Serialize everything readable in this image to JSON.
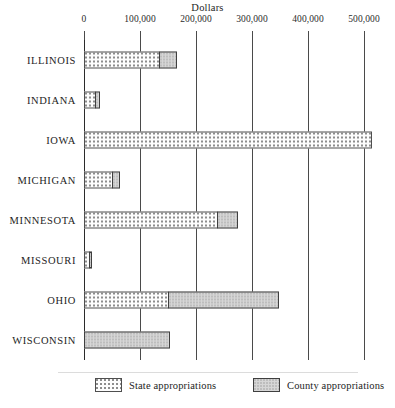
{
  "chart_data": {
    "type": "bar",
    "orientation": "horizontal",
    "stacked": true,
    "title": "",
    "xlabel": "Dollars",
    "ylabel": "",
    "xlim": [
      0,
      520000
    ],
    "grid": true,
    "legend_position": "bottom",
    "xticks": [
      0,
      100000,
      200000,
      300000,
      400000,
      500000
    ],
    "xticklabels": [
      "0",
      "100,000",
      "200,000",
      "300,000",
      "400,000",
      "500,000"
    ],
    "categories": [
      "ILLINOIS",
      "INDIANA",
      "IOWA",
      "MICHIGAN",
      "MINNESOTA",
      "MISSOURI",
      "OHIO",
      "WISCONSIN"
    ],
    "series": [
      {
        "name": "State appropriations",
        "pattern": "dotted",
        "values": [
          136000,
          21000,
          514000,
          52000,
          239000,
          11000,
          152000,
          0
        ]
      },
      {
        "name": "County appropriations",
        "pattern": "solid-gray",
        "values": [
          32000,
          9000,
          0,
          14000,
          38000,
          5000,
          198000,
          154000
        ]
      }
    ],
    "totals": [
      168000,
      30000,
      514000,
      66000,
      277000,
      16000,
      350000,
      154000
    ]
  },
  "axis": {
    "title": "Dollars",
    "ticks": [
      {
        "label": "0",
        "value": 0
      },
      {
        "label": "100,000",
        "value": 100000
      },
      {
        "label": "200,000",
        "value": 200000
      },
      {
        "label": "300,000",
        "value": 300000
      },
      {
        "label": "400,000",
        "value": 400000
      },
      {
        "label": "500,000",
        "value": 500000
      }
    ]
  },
  "rows": [
    {
      "label": "ILLINOIS",
      "state": 136000,
      "county": 32000
    },
    {
      "label": "INDIANA",
      "state": 21000,
      "county": 9000
    },
    {
      "label": "IOWA",
      "state": 514000,
      "county": 0
    },
    {
      "label": "MICHIGAN",
      "state": 52000,
      "county": 14000
    },
    {
      "label": "MINNESOTA",
      "state": 239000,
      "county": 38000
    },
    {
      "label": "MISSOURI",
      "state": 11000,
      "county": 5000
    },
    {
      "label": "OHIO",
      "state": 152000,
      "county": 198000
    },
    {
      "label": "WISCONSIN",
      "state": 0,
      "county": 154000
    }
  ],
  "legend": {
    "state_label": "State appropriations",
    "county_label": "County appropriations"
  },
  "colors": {
    "state_fill": "#fdfdfd",
    "state_dots": "#8d8d8d",
    "county_fill": "#d6d6d6",
    "outline": "#4f4f4f",
    "gridline": "#4a4a4a",
    "text": "#1d1d1d"
  }
}
